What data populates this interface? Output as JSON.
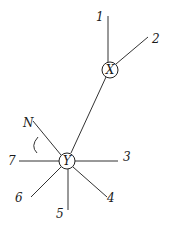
{
  "diagram": {
    "nodes": {
      "x": {
        "label": "X",
        "cx": 110,
        "cy": 70,
        "r": 8
      },
      "y": {
        "label": "Y",
        "cx": 67,
        "cy": 161,
        "r": 8
      }
    },
    "connector": {
      "from": "X",
      "to": "Y"
    },
    "edges": [
      {
        "label": "1",
        "node": "X"
      },
      {
        "label": "2",
        "node": "X"
      },
      {
        "label": "3",
        "node": "Y"
      },
      {
        "label": "4",
        "node": "Y"
      },
      {
        "label": "5",
        "node": "Y"
      },
      {
        "label": "6",
        "node": "Y"
      },
      {
        "label": "7",
        "node": "Y"
      },
      {
        "label": "N",
        "node": "Y"
      }
    ],
    "angle_marker": "arc between N and 7"
  }
}
